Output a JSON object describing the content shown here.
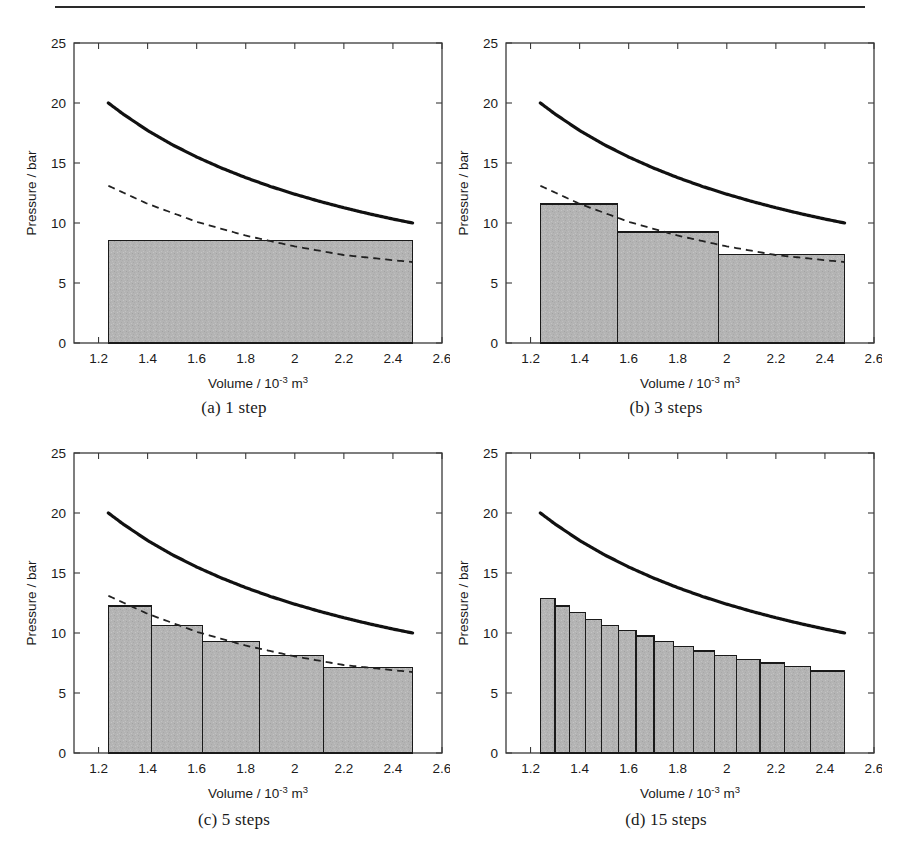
{
  "figure": {
    "type": "multi-panel-figure",
    "layout": "2x2",
    "top_rule": true,
    "panel_count": 4
  },
  "axes": {
    "xlabel_main": "Volume / 10",
    "xlabel_exp": "-3",
    "xlabel_unit": " m",
    "xlabel_unit_exp": "3",
    "ylabel": "Pressure / bar",
    "xticks": [
      "1.2",
      "1.4",
      "1.6",
      "1.8",
      "2",
      "2.2",
      "2.4",
      "2.6"
    ],
    "xtick_values": [
      1.2,
      1.4,
      1.6,
      1.8,
      2.0,
      2.2,
      2.4,
      2.6
    ],
    "yticks": [
      "0",
      "5",
      "10",
      "15",
      "20",
      "25"
    ],
    "ytick_values": [
      0,
      5,
      10,
      15,
      20,
      25
    ],
    "xlim": [
      1.1,
      2.6
    ],
    "ylim": [
      0,
      25
    ]
  },
  "panels": [
    {
      "id": "a",
      "caption": "(a)  1 step",
      "steps": 1,
      "has_dashed": true
    },
    {
      "id": "b",
      "caption": "(b)  3 steps",
      "steps": 3,
      "has_dashed": true
    },
    {
      "id": "c",
      "caption": "(c)  5 steps",
      "steps": 5,
      "has_dashed": true
    },
    {
      "id": "d",
      "caption": "(d)  15 steps",
      "steps": 15,
      "has_dashed": false
    }
  ],
  "colors": {
    "bar_fill": "#b4b4b4",
    "bar_edge": "#1a1a1a",
    "solid_curve": "#111111",
    "dashed_curve": "#222222",
    "axis": "#3a3a3a",
    "text": "#1a1a1a"
  },
  "chart_data": {
    "type": "bar",
    "title": "",
    "xlabel": "Volume / 10^-3 m^3",
    "ylabel": "Pressure / bar",
    "xlim": [
      1.1,
      2.6
    ],
    "ylim": [
      0,
      25
    ],
    "xticks": [
      1.2,
      1.4,
      1.6,
      1.8,
      2.0,
      2.2,
      2.4,
      2.6
    ],
    "yticks": [
      0,
      5,
      10,
      15,
      20,
      25
    ],
    "grid": false,
    "legend": "none",
    "volume_range": [
      1.24,
      2.48
    ],
    "series": [
      {
        "name": "reversible isotherm (solid)",
        "style": "solid",
        "type": "line",
        "x": [
          1.24,
          1.3,
          1.4,
          1.5,
          1.6,
          1.7,
          1.8,
          1.9,
          2.0,
          2.1,
          2.2,
          2.3,
          2.4,
          2.48
        ],
        "values": [
          20.0,
          19.08,
          17.71,
          16.53,
          15.5,
          14.59,
          13.78,
          13.05,
          12.4,
          11.81,
          11.27,
          10.78,
          10.33,
          10.0
        ]
      },
      {
        "name": "quasi-static step envelope (dashed)",
        "style": "dashed",
        "type": "line",
        "panels": [
          "a",
          "b",
          "c"
        ],
        "x": [
          1.24,
          1.4,
          1.6,
          1.8,
          2.0,
          2.2,
          2.4,
          2.48
        ],
        "values": [
          13.1,
          11.6,
          10.1,
          8.95,
          8.05,
          7.33,
          6.9,
          6.75
        ]
      }
    ],
    "panel_bars": {
      "a": {
        "steps": 1,
        "edges": [
          1.24,
          2.48
        ],
        "values": [
          8.55
        ]
      },
      "b": {
        "steps": 3,
        "edges": [
          1.24,
          1.5533,
          1.9667,
          2.48
        ],
        "values": [
          11.6,
          9.25,
          7.4
        ]
      },
      "c": {
        "steps": 5,
        "edges": [
          1.24,
          1.4167,
          1.6233,
          1.8567,
          2.1167,
          2.48
        ],
        "values": [
          12.25,
          10.65,
          9.3,
          8.15,
          7.15
        ]
      },
      "d": {
        "steps": 15,
        "edges": [
          1.24,
          1.3,
          1.36,
          1.424,
          1.49,
          1.558,
          1.63,
          1.704,
          1.782,
          1.864,
          1.95,
          2.04,
          2.136,
          2.236,
          2.34,
          2.48
        ],
        "values": [
          12.9,
          12.25,
          11.7,
          11.15,
          10.65,
          10.2,
          9.75,
          9.3,
          8.9,
          8.5,
          8.15,
          7.8,
          7.5,
          7.2,
          6.85
        ]
      }
    }
  }
}
